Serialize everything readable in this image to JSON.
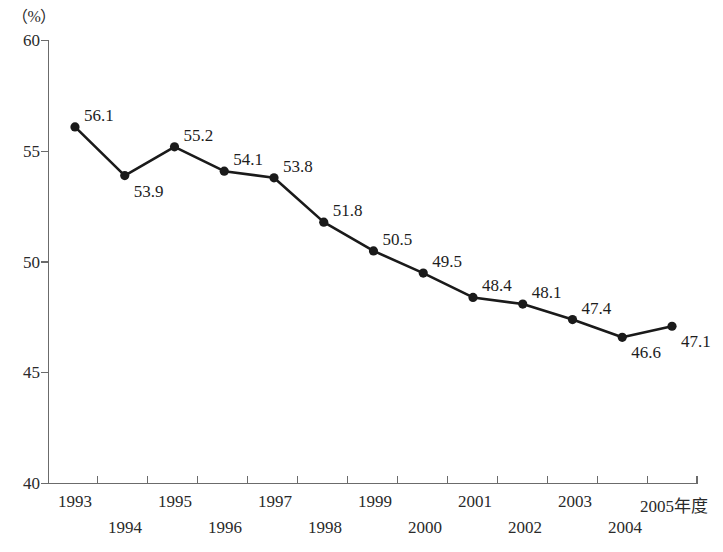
{
  "chart_data": {
    "type": "line",
    "title": "",
    "subtitle": "",
    "xlabel": "",
    "ylabel": "",
    "unit_label": "（%）",
    "x_axis_suffix": "年度",
    "categories": [
      "1993",
      "1994",
      "1995",
      "1996",
      "1997",
      "1998",
      "1999",
      "2000",
      "2001",
      "2002",
      "2003",
      "2004",
      "2005年度"
    ],
    "values": [
      56.1,
      53.9,
      55.2,
      54.1,
      53.8,
      51.8,
      50.5,
      49.5,
      48.4,
      48.1,
      47.4,
      46.6,
      47.1
    ],
    "point_labels": [
      "56.1",
      "53.9",
      "55.2",
      "54.1",
      "53.8",
      "51.8",
      "50.5",
      "49.5",
      "48.4",
      "48.1",
      "47.4",
      "46.6",
      "47.1"
    ],
    "ylim": [
      40,
      60
    ],
    "yticks": [
      60,
      55,
      50,
      45,
      40
    ],
    "ytick_labels": [
      "60",
      "55",
      "50",
      "45",
      "40"
    ],
    "xtick_labels_row_top": [
      "1993",
      "1995",
      "1997",
      "1999",
      "2001",
      "2003",
      "2005年度"
    ],
    "xtick_labels_row_bottom": [
      "1994",
      "1996",
      "1998",
      "2000",
      "2002",
      "2004"
    ],
    "grid": false,
    "legend": null,
    "series_color": "#1a1a1a",
    "axis_color": "#6b6b6b",
    "marker": "circle"
  }
}
